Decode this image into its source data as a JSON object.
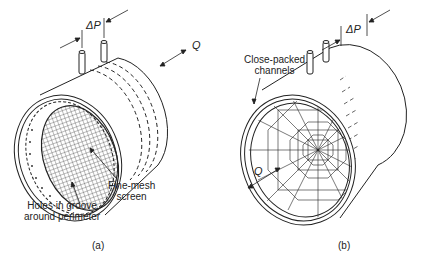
{
  "figure_a": {
    "pressure_label": "ΔP",
    "flow_label": "Q",
    "mesh_label_line1": "Fine-mesh",
    "mesh_label_line2": "screen",
    "holes_label_line1": "Holes in groove",
    "holes_label_line2": "around perimeter",
    "caption": "(a)"
  },
  "figure_b": {
    "pressure_label": "ΔP",
    "flow_label": "Q",
    "channels_label_line1": "Close-packed",
    "channels_label_line2": "channels",
    "caption": "(b)"
  },
  "colors": {
    "line": "#222222",
    "background": "#ffffff"
  }
}
